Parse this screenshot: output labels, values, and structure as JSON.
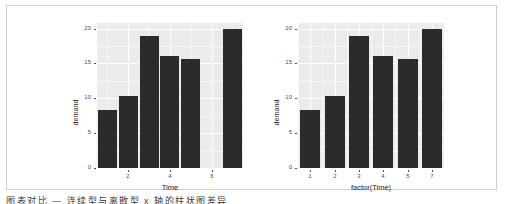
{
  "figure": {
    "background": "#ffffff",
    "border_color": "#cfcfcf",
    "panel_background": "#ebebeb",
    "gridline_color": "#ffffff",
    "bar_color": "#2b2b2b",
    "axis_text_color": "#4d4d4d",
    "axis_title_color": "#1a1a1a"
  },
  "caption": {
    "text": "图表对比 — 连续型与离散型 x 轴的柱状图差异"
  },
  "chart_data": [
    {
      "type": "bar",
      "title": "",
      "xlabel": "Time",
      "ylabel": "demand",
      "x": [
        1,
        2,
        3,
        4,
        5,
        7
      ],
      "values": [
        8.3,
        10.3,
        19.0,
        16.0,
        15.6,
        19.9
      ],
      "x_scale": "continuous",
      "xlim": [
        0.5,
        7.5
      ],
      "xticks": [
        2,
        4,
        6
      ],
      "xticklabels": [
        "2",
        "4",
        "6"
      ],
      "ylim": [
        0,
        20.8
      ],
      "yticks": [
        0,
        5,
        10,
        15,
        20
      ],
      "yticklabels": [
        "0",
        "5",
        "10",
        "15",
        "20"
      ],
      "grid": true,
      "legend": "none",
      "note": "continuous x axis leaves an empty slot where Time = 6 has no observation"
    },
    {
      "type": "bar",
      "title": "",
      "xlabel": "factor(Time)",
      "ylabel": "demand",
      "categories": [
        "1",
        "2",
        "3",
        "4",
        "5",
        "7"
      ],
      "values": [
        8.3,
        10.3,
        19.0,
        16.0,
        15.6,
        19.9
      ],
      "x_scale": "discrete",
      "xticks": [
        1,
        2,
        3,
        4,
        5,
        6
      ],
      "xticklabels": [
        "1",
        "2",
        "3",
        "4",
        "5",
        "7"
      ],
      "ylim": [
        0,
        20.8
      ],
      "yticks": [
        0,
        5,
        10,
        15,
        20
      ],
      "yticklabels": [
        "0",
        "5",
        "10",
        "15",
        "20"
      ],
      "grid": true,
      "legend": "none",
      "note": "discrete x axis drops the empty Time = 6 slot, bars evenly spaced"
    }
  ]
}
